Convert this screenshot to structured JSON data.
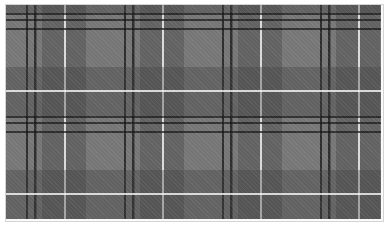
{
  "image": {
    "subject": "grey tartan plaid fabric pattern",
    "colors": {
      "base": "#767676",
      "dark_stripe": "#141414",
      "shade_band": "#3c3c3c",
      "white_stripe": "#ebebeb",
      "border": "#d4d4d4"
    },
    "pattern": {
      "vertical_period_px": 98,
      "horizontal_period_px": 103
    }
  }
}
